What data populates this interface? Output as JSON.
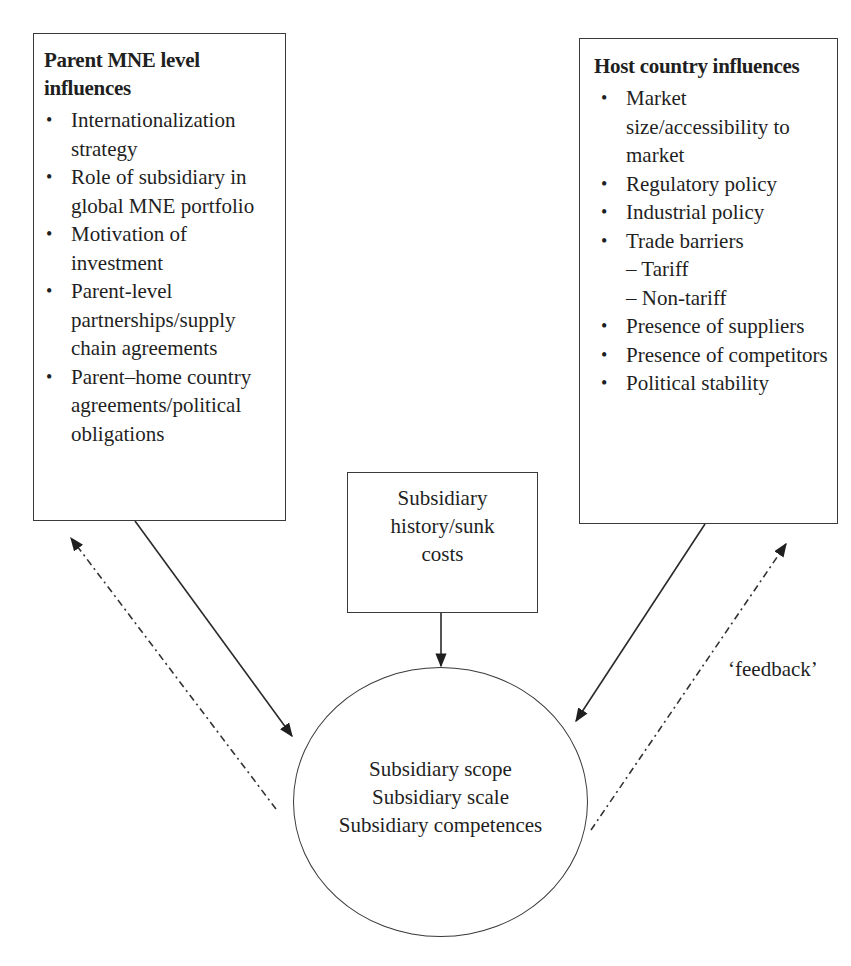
{
  "diagram": {
    "parent_box": {
      "title": "Parent MNE level influences",
      "items": [
        "Internationalization strategy",
        "Role of subsidiary in global MNE portfolio",
        "Motivation of investment",
        "Parent-level partnerships/supply chain agreements",
        "Parent–home country agreements/political obligations"
      ]
    },
    "host_box": {
      "title": "Host country influences",
      "items": [
        "Market size/accessibility to market",
        "Regulatory policy",
        "Industrial policy",
        "Trade barriers",
        "Presence of suppliers",
        "Presence of competitors",
        "Political stability"
      ],
      "trade_barriers_sub": [
        "– Tariff",
        "– Non-tariff"
      ]
    },
    "history_box": {
      "lines": [
        "Subsidiary",
        "history/sunk",
        "costs"
      ]
    },
    "outcome_circle": {
      "lines": [
        "Subsidiary scope",
        "Subsidiary scale",
        "Subsidiary competences"
      ]
    },
    "feedback_label": "‘feedback’",
    "edges": [
      {
        "from": "parent_box",
        "to": "outcome_circle",
        "style": "solid"
      },
      {
        "from": "host_box",
        "to": "outcome_circle",
        "style": "solid"
      },
      {
        "from": "history_box",
        "to": "outcome_circle",
        "style": "solid"
      },
      {
        "from": "outcome_circle",
        "to": "parent_box",
        "style": "dash-dot",
        "label": "feedback"
      },
      {
        "from": "outcome_circle",
        "to": "host_box",
        "style": "dash-dot",
        "label": "feedback"
      }
    ],
    "colors": {
      "line": "#1f1f1f",
      "background": "#ffffff"
    }
  }
}
